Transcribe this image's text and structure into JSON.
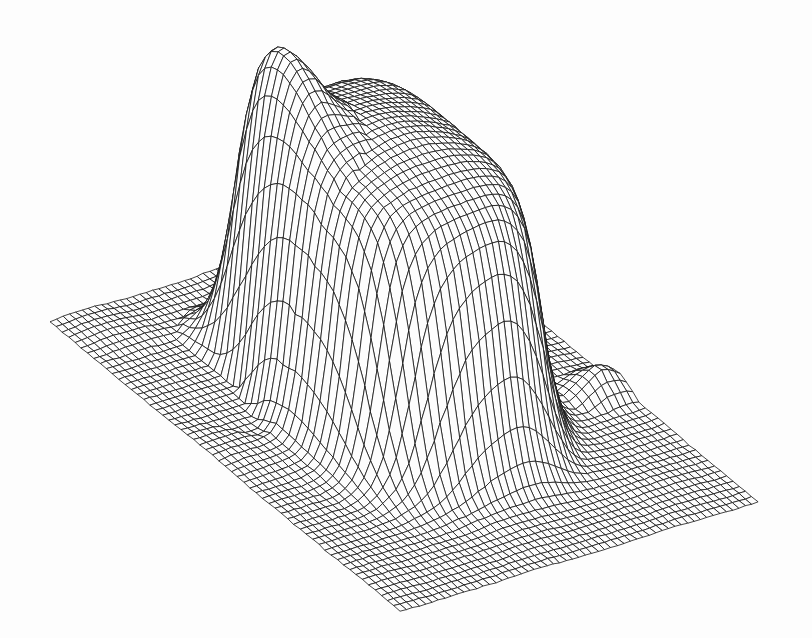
{
  "figure": {
    "kind": "wireframe-surface-plot",
    "title": "",
    "caption": "",
    "background_color": "#fdfdfd",
    "line_color": "#141414",
    "width": 812,
    "height": 638,
    "rendering": "hidden-line-removed mesh, monochrome scanned line drawing",
    "projection": "isometric / oblique parallel"
  },
  "chart_data": {
    "type": "surface",
    "title": "",
    "subtitle": "",
    "xlabel": "",
    "ylabel": "",
    "zlabel": "",
    "grid": true,
    "legend": "none",
    "axis_ticks_visible": false,
    "axis_labels_visible": false,
    "nx": 56,
    "ny": 56,
    "xlim": [
      0,
      1
    ],
    "ylim": [
      0,
      1
    ],
    "zlim": [
      0,
      1
    ],
    "features": [
      {
        "name": "base-plane",
        "z": 0.0,
        "note": "flat square grid filling the whole diamond footprint"
      },
      {
        "name": "plateau-top",
        "z": 0.95,
        "note": "domed flat summit covering central region"
      },
      {
        "name": "summit-notch",
        "z": 0.8,
        "note": "v-shaped notch at back-right ridge"
      },
      {
        "name": "front-cliff",
        "z_drop": 0.95,
        "note": "near-vertical face, dense vertical mesh lines"
      },
      {
        "name": "right-cliff",
        "z_drop": 0.9,
        "note": "vertical face producing lens-shaped crossings"
      },
      {
        "name": "foreground-crater",
        "z": 0.18,
        "note": "shallow depression in front-left flank"
      }
    ],
    "surface_params": {
      "plateau_center_u": 0.46,
      "plateau_center_v": 0.5,
      "plateau_radius_u": 0.3,
      "plateau_radius_v": 0.27,
      "plateau_height": 1.0,
      "edge_sharpness": 14.0,
      "crater_center_u": 0.3,
      "crater_center_v": 0.22,
      "crater_radius": 0.12,
      "crater_depth": 0.22,
      "ridge_amplitude": 0.07
    },
    "projection_geometry": {
      "left_corner": [
        50,
        322
      ],
      "right_corner": [
        772,
        324
      ],
      "bottom_corner": [
        400,
        612
      ],
      "back_corner_base": [
        408,
        212
      ],
      "summit_top_y": 44
    }
  },
  "annotations": []
}
